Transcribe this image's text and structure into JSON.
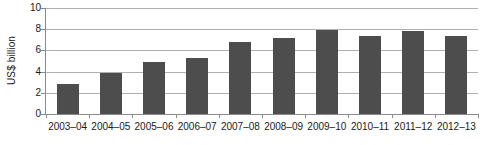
{
  "chart_data": {
    "type": "bar",
    "title": "",
    "xlabel": "",
    "ylabel": "US$ billion",
    "ylim": [
      0,
      10
    ],
    "yticks": [
      0,
      2,
      4,
      6,
      8,
      10
    ],
    "grid": true,
    "legend": "none",
    "bar_color": "#4d4d4d",
    "gridline_color": "#b0b0b0",
    "axis_color": "#8a8a8a",
    "categories": [
      "2003–04",
      "2004–05",
      "2005–06",
      "2006–07",
      "2007–08",
      "2008–09",
      "2009–10",
      "2010–11",
      "2011–12",
      "2012–13"
    ],
    "values": [
      2.8,
      3.85,
      4.9,
      5.25,
      6.8,
      7.2,
      7.9,
      7.35,
      7.85,
      7.35
    ]
  }
}
